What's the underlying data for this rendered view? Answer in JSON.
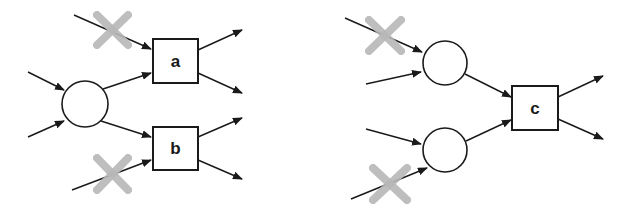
{
  "diagram": {
    "left": {
      "nodes": {
        "box_a": {
          "label": "a"
        },
        "box_b": {
          "label": "b"
        }
      }
    },
    "right": {
      "nodes": {
        "box_c": {
          "label": "c"
        }
      }
    },
    "colors": {
      "stroke": "#1a1a1a",
      "cross": "#b8b8b8",
      "background": "#ffffff"
    },
    "icons": {
      "blocked_marker": "gray-x-cross"
    }
  }
}
